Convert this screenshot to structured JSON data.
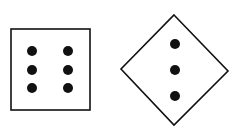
{
  "diagram": {
    "background": "#ffffff",
    "stroke_color": "#111111",
    "dot_color": "#111111",
    "shapes": [
      {
        "name": "square-six-dots",
        "type": "square",
        "x": 11,
        "y": 29,
        "width": 79,
        "height": 81,
        "dots": [
          {
            "cx": 32,
            "cy": 51
          },
          {
            "cx": 68,
            "cy": 51
          },
          {
            "cx": 32,
            "cy": 70
          },
          {
            "cx": 68,
            "cy": 70
          },
          {
            "cx": 32,
            "cy": 88
          },
          {
            "cx": 68,
            "cy": 88
          }
        ]
      },
      {
        "name": "diamond-three-dots",
        "type": "diamond",
        "points": [
          [
            174,
            15
          ],
          [
            228,
            71
          ],
          [
            174,
            125
          ],
          [
            121,
            69
          ]
        ],
        "dots": [
          {
            "cx": 175,
            "cy": 44
          },
          {
            "cx": 175,
            "cy": 70
          },
          {
            "cx": 175,
            "cy": 96
          }
        ]
      }
    ],
    "dot_radius": 5
  }
}
